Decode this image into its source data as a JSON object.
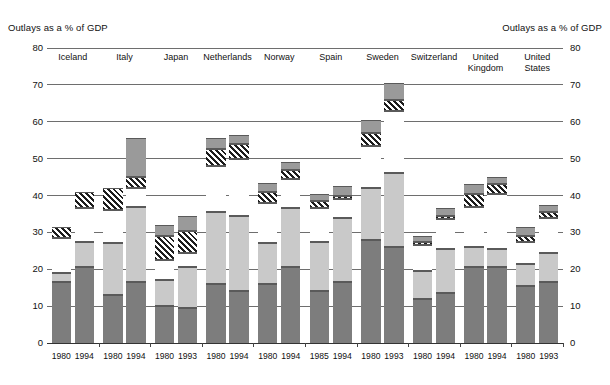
{
  "titles": {
    "left": "Outlays as a % of GDP",
    "right": "Outlays as a % of GDP"
  },
  "axis": {
    "y_ticks": [
      "80",
      "70",
      "60",
      "50",
      "40",
      "30",
      "20",
      "10",
      "0"
    ]
  },
  "chart_data": {
    "type": "bar",
    "subtype": "stacked-bar-grouped",
    "title": "Outlays as a % of GDP",
    "xlabel": "",
    "ylabel": "Outlays as a % of GDP",
    "ylim": [
      0,
      80
    ],
    "ytick_values": [
      0,
      10,
      20,
      30,
      40,
      50,
      60,
      70,
      80
    ],
    "grid": true,
    "legend": "none",
    "series": [
      {
        "name": "segment-1-dark-gray",
        "color": "#7d7d7d"
      },
      {
        "name": "segment-2-light-gray",
        "color": "#c9c9c9"
      },
      {
        "name": "segment-3-white",
        "color": "#ffffff"
      },
      {
        "name": "segment-4-hatched",
        "color": "#1d1d1d"
      },
      {
        "name": "segment-5-medium-gray",
        "color": "#9a9a9a"
      }
    ],
    "groups": [
      {
        "country": "Iceland",
        "bars": [
          {
            "year": "1980",
            "total": 31.5,
            "segments": [
              16.5,
              2.5,
              9.5,
              3.0,
              0.0
            ]
          },
          {
            "year": "1994",
            "total": 41.0,
            "segments": [
              20.5,
              7.0,
              9.0,
              4.5,
              0.0
            ]
          }
        ]
      },
      {
        "country": "Italy",
        "bars": [
          {
            "year": "1980",
            "total": 42.0,
            "segments": [
              13.0,
              14.0,
              9.0,
              6.0,
              0.0
            ]
          },
          {
            "year": "1994",
            "total": 55.5,
            "segments": [
              16.5,
              20.5,
              5.0,
              3.0,
              10.5
            ]
          }
        ]
      },
      {
        "country": "Japan",
        "bars": [
          {
            "year": "1980",
            "total": 32.0,
            "segments": [
              10.0,
              7.0,
              5.5,
              6.5,
              3.0
            ]
          },
          {
            "year": "1993",
            "total": 34.5,
            "segments": [
              9.5,
              11.0,
              4.0,
              6.0,
              4.0
            ]
          }
        ]
      },
      {
        "country": "Netherlands",
        "bars": [
          {
            "year": "1980",
            "total": 55.5,
            "segments": [
              16.0,
              19.5,
              12.5,
              4.5,
              3.0
            ]
          },
          {
            "year": "1994",
            "total": 56.5,
            "segments": [
              14.0,
              20.5,
              15.5,
              4.0,
              2.5
            ]
          }
        ]
      },
      {
        "country": "Norway",
        "bars": [
          {
            "year": "1980",
            "total": 43.5,
            "segments": [
              16.0,
              11.0,
              11.0,
              3.0,
              2.5
            ]
          },
          {
            "year": "1994",
            "total": 49.0,
            "segments": [
              20.5,
              16.0,
              8.0,
              2.5,
              2.0
            ]
          }
        ]
      },
      {
        "country": "Spain",
        "bars": [
          {
            "year": "1985",
            "total": 40.5,
            "segments": [
              14.0,
              13.5,
              9.0,
              2.0,
              2.0
            ]
          },
          {
            "year": "1994",
            "total": 42.5,
            "segments": [
              16.5,
              17.5,
              5.0,
              1.0,
              2.5
            ]
          }
        ]
      },
      {
        "country": "Sweden",
        "bars": [
          {
            "year": "1980",
            "total": 60.5,
            "segments": [
              28.0,
              14.0,
              11.5,
              3.5,
              3.5
            ]
          },
          {
            "year": "1993",
            "total": 70.5,
            "segments": [
              26.0,
              20.0,
              17.0,
              3.0,
              4.5
            ]
          }
        ]
      },
      {
        "country": "Switzerland",
        "bars": [
          {
            "year": "1980",
            "total": 29.0,
            "segments": [
              12.0,
              7.5,
              7.0,
              1.0,
              1.5
            ]
          },
          {
            "year": "1994",
            "total": 36.5,
            "segments": [
              13.5,
              12.0,
              8.0,
              1.0,
              2.0
            ]
          }
        ]
      },
      {
        "country": "United\nKingdom",
        "bars": [
          {
            "year": "1980",
            "total": 43.0,
            "segments": [
              20.5,
              5.5,
              11.0,
              3.5,
              2.5
            ]
          },
          {
            "year": "1994",
            "total": 45.0,
            "segments": [
              20.5,
              5.0,
              15.0,
              2.5,
              2.0
            ]
          }
        ]
      },
      {
        "country": "United\nStates",
        "bars": [
          {
            "year": "1980",
            "total": 31.5,
            "segments": [
              15.5,
              6.0,
              6.0,
              1.5,
              2.5
            ]
          },
          {
            "year": "1993",
            "total": 37.5,
            "segments": [
              16.5,
              8.0,
              9.5,
              1.5,
              2.0
            ]
          }
        ]
      }
    ]
  }
}
